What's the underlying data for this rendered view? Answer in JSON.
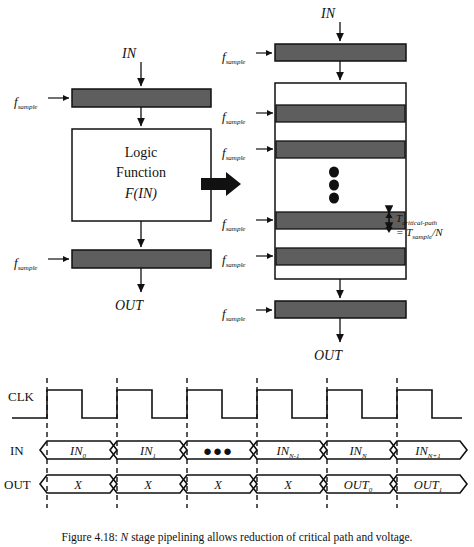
{
  "figure": {
    "caption_prefix": "Figure 4.18:",
    "caption_italic": "N",
    "caption_rest": "stage pipelining allows reduction of critical path and voltage.",
    "caption_full": "Figure 4.18: N stage pipelining allows reduction of critical path and voltage."
  },
  "colors": {
    "register_fill": "#5e5e5e",
    "stroke": "#111111",
    "background": "#ffffff",
    "dot": "#101010"
  },
  "left_diagram": {
    "name": "unpipelined-datapath",
    "input_label": "IN",
    "output_label": "OUT",
    "clock_label_top": "f",
    "clock_sub_top": "sample",
    "clock_label_bottom": "f",
    "clock_sub_bottom": "sample",
    "logic_line1": "Logic",
    "logic_line2": "Function",
    "logic_line3": "F(IN)",
    "register_count": 2
  },
  "transform_arrow": {
    "name": "transform-arrow",
    "direction": "right"
  },
  "right_diagram": {
    "name": "pipelined-datapath",
    "input_label": "IN",
    "output_label": "OUT",
    "clock_labels": [
      {
        "base": "f",
        "sub": "sample"
      },
      {
        "base": "f",
        "sub": "sample"
      },
      {
        "base": "f",
        "sub": "sample"
      },
      {
        "base": "f",
        "sub": "sample"
      },
      {
        "base": "f",
        "sub": "sample"
      },
      {
        "base": "f",
        "sub": "sample"
      }
    ],
    "pipeline_register_count": 4,
    "ellipsis_dots": 3,
    "annotation": {
      "line1_base": "T",
      "line1_sub": "critical-path",
      "line2_eq": "= T",
      "line2_sub": "sample",
      "line2_tail": "/N",
      "full": "T critical-path = T sample / N"
    }
  },
  "timing_diagram": {
    "name": "timing-waveforms",
    "rows": [
      {
        "label": "CLK",
        "type": "clock",
        "cycles": 6
      },
      {
        "label": "IN",
        "type": "bus",
        "cells": [
          {
            "base": "IN",
            "sub": "0",
            "text": "IN0"
          },
          {
            "base": "IN",
            "sub": "1",
            "text": "IN1"
          },
          {
            "base": "",
            "sub": "",
            "text": "●●●"
          },
          {
            "base": "IN",
            "sub": "N-1",
            "text": "INN-1"
          },
          {
            "base": "IN",
            "sub": "N",
            "text": "INN"
          },
          {
            "base": "IN",
            "sub": "N+1",
            "text": "INN+1"
          }
        ]
      },
      {
        "label": "OUT",
        "type": "bus",
        "cells": [
          {
            "base": "X",
            "sub": "",
            "text": "X"
          },
          {
            "base": "X",
            "sub": "",
            "text": "X"
          },
          {
            "base": "X",
            "sub": "",
            "text": "X"
          },
          {
            "base": "X",
            "sub": "",
            "text": "X"
          },
          {
            "base": "OUT",
            "sub": "0",
            "text": "OUT0"
          },
          {
            "base": "OUT",
            "sub": "1",
            "text": "OUT1"
          }
        ]
      }
    ],
    "guide_line_count": 6
  }
}
